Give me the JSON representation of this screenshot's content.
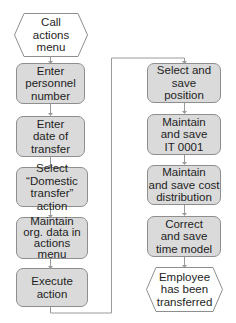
{
  "diagram": {
    "colors": {
      "box_fill": "#dadada",
      "box_border": "#8e8e8e",
      "connector": "#9a9a9a",
      "text": "#1e1e1e"
    },
    "left_column": [
      {
        "id": "call-actions-menu",
        "shape": "hexagon",
        "label": "Call\nactions\nmenu"
      },
      {
        "id": "enter-personnel-number",
        "shape": "rounded-box",
        "label": "Enter\npersonnel\nnumber"
      },
      {
        "id": "enter-date-of-transfer",
        "shape": "rounded-box",
        "label": "Enter\ndate of\ntransfer"
      },
      {
        "id": "select-domestic-transfer",
        "shape": "rounded-box",
        "label": "Select\n“Domestic\ntransfer” action"
      },
      {
        "id": "maintain-org-data",
        "shape": "rounded-box",
        "label": "Maintain\norg. data in\nactions\nmenu"
      },
      {
        "id": "execute-action",
        "shape": "rounded-box",
        "label": "Execute\naction"
      }
    ],
    "right_column": [
      {
        "id": "select-save-position",
        "shape": "rounded-box",
        "label": "Select and\nsave\nposition"
      },
      {
        "id": "maintain-save-it0001",
        "shape": "rounded-box",
        "label": "Maintain\nand save\nIT 0001"
      },
      {
        "id": "maintain-save-cost-distribution",
        "shape": "rounded-box",
        "label": "Maintain\nand save cost\ndistribution"
      },
      {
        "id": "correct-save-time-model",
        "shape": "rounded-box",
        "label": "Correct\nand save\ntime model"
      },
      {
        "id": "employee-transferred",
        "shape": "hexagon",
        "label": "Employee\nhas been\ntransferred"
      }
    ]
  }
}
